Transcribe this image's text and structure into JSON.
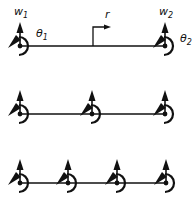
{
  "figure": {
    "background": "#ffffff",
    "stroke_color": "#111111",
    "rows": [
      {
        "id": "single-element",
        "y": 46,
        "nodes": [
          20,
          165
        ],
        "labels": {
          "w1": {
            "base": "w",
            "sub": "1"
          },
          "w2": {
            "base": "w",
            "sub": "2"
          },
          "theta1": {
            "base": "θ",
            "sub": "1"
          },
          "theta2": {
            "base": "θ",
            "sub": "2"
          },
          "r": "r"
        }
      },
      {
        "id": "two-elements",
        "y": 114,
        "nodes": [
          20,
          92,
          165
        ]
      },
      {
        "id": "three-elements",
        "y": 183,
        "nodes": [
          20,
          68,
          117,
          166
        ]
      }
    ]
  }
}
